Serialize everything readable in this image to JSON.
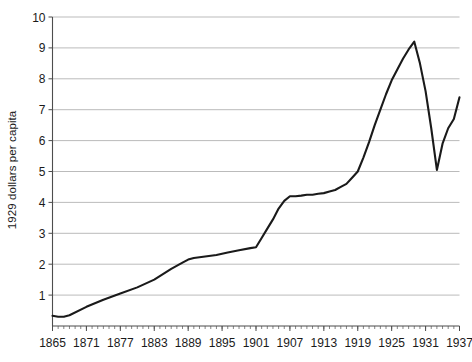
{
  "chart_data": {
    "type": "line",
    "title": "",
    "xlabel": "",
    "ylabel": "1929 dollars per capita",
    "xlim": [
      1865,
      1937
    ],
    "ylim": [
      0,
      10
    ],
    "grid": true,
    "legend": false,
    "xticks": [
      "1865",
      "1871",
      "1877",
      "1883",
      "1889",
      "1895",
      "1901",
      "1907",
      "1913",
      "1919",
      "1925",
      "1931",
      "1937"
    ],
    "xtick_values": [
      1865,
      1871,
      1877,
      1883,
      1889,
      1895,
      1901,
      1907,
      1913,
      1919,
      1925,
      1931,
      1937
    ],
    "yticks": [
      "1",
      "2",
      "3",
      "4",
      "5",
      "6",
      "7",
      "8",
      "9",
      "10"
    ],
    "ytick_values": [
      1,
      2,
      3,
      4,
      5,
      6,
      7,
      8,
      9,
      10
    ],
    "minor_xtick_interval": 1,
    "series": [
      {
        "name": "1929 dollars per capita",
        "color": "#1a1a1a",
        "x": [
          1865,
          1866,
          1867,
          1868,
          1871,
          1874,
          1877,
          1880,
          1883,
          1886,
          1888,
          1889,
          1890,
          1892,
          1894,
          1896,
          1898,
          1900,
          1901,
          1902,
          1903,
          1904,
          1905,
          1906,
          1907,
          1908,
          1909,
          1910,
          1911,
          1912,
          1913,
          1914,
          1915,
          1916,
          1917,
          1918,
          1919,
          1920,
          1921,
          1922,
          1923,
          1924,
          1925,
          1926,
          1927,
          1928,
          1929,
          1930,
          1931,
          1932,
          1933,
          1934,
          1935,
          1936,
          1937
        ],
        "y": [
          0.33,
          0.3,
          0.3,
          0.35,
          0.62,
          0.85,
          1.05,
          1.25,
          1.5,
          1.85,
          2.05,
          2.15,
          2.2,
          2.25,
          2.3,
          2.38,
          2.45,
          2.52,
          2.55,
          2.85,
          3.15,
          3.45,
          3.8,
          4.05,
          4.2,
          4.2,
          4.22,
          4.25,
          4.25,
          4.28,
          4.3,
          4.35,
          4.4,
          4.5,
          4.6,
          4.8,
          5.0,
          5.45,
          5.95,
          6.5,
          7.0,
          7.5,
          7.95,
          8.3,
          8.65,
          8.95,
          9.2,
          8.5,
          7.6,
          6.4,
          5.05,
          5.9,
          6.4,
          6.7,
          7.4
        ]
      }
    ]
  },
  "axes": {
    "y_axis_title": "1929 dollars per capita"
  }
}
